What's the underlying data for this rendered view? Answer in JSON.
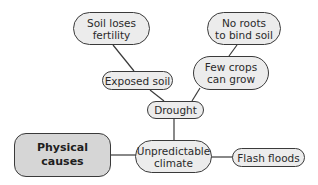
{
  "diagram": {
    "type": "mind-map",
    "colors": {
      "node_fill": "#ececec",
      "root_fill": "#d6d6d6",
      "stroke": "#3a3a3a",
      "text": "#2a2a2a"
    },
    "nodes": {
      "physical_causes": {
        "label": "Physical\ncauses"
      },
      "unpredictable_climate": {
        "label": "Unpredictable\nclimate"
      },
      "flash_floods": {
        "label": "Flash floods"
      },
      "drought": {
        "label": "Drought"
      },
      "exposed_soil": {
        "label": "Exposed soil"
      },
      "few_crops": {
        "label": "Few crops\ncan grow"
      },
      "soil_loses_fertility": {
        "label": "Soil loses\nfertility"
      },
      "no_roots": {
        "label": "No roots\nto bind soil"
      }
    },
    "edges": [
      {
        "from": "Physical causes",
        "to": "Unpredictable climate"
      },
      {
        "from": "Unpredictable climate",
        "to": "Flash floods"
      },
      {
        "from": "Unpredictable climate",
        "to": "Drought"
      },
      {
        "from": "Drought",
        "to": "Exposed soil"
      },
      {
        "from": "Drought",
        "to": "Few crops can grow"
      },
      {
        "from": "Exposed soil",
        "to": "Soil loses fertility"
      },
      {
        "from": "Few crops can grow",
        "to": "No roots to bind soil"
      }
    ]
  }
}
